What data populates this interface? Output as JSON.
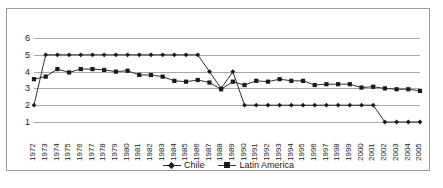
{
  "chart_data": {
    "type": "line",
    "title": "",
    "subtitle": "",
    "xlabel": "",
    "ylabel": "",
    "ylim": [
      1,
      6
    ],
    "yticks": [
      1,
      2,
      3,
      4,
      5,
      6
    ],
    "grid": true,
    "legend_position": "bottom",
    "categories": [
      "1972",
      "1973",
      "1974",
      "1975",
      "1976",
      "1977",
      "1978",
      "1979",
      "1980",
      "1981",
      "1982",
      "1983",
      "1984",
      "1985",
      "1986",
      "1987",
      "1988",
      "1989",
      "1990",
      "1991",
      "1992",
      "1993",
      "1994",
      "1995",
      "1996",
      "1997",
      "1998",
      "1999",
      "2000",
      "2001",
      "2002",
      "2003",
      "2004",
      "2005"
    ],
    "series": [
      {
        "name": "Chile",
        "marker": "diamond",
        "color": "#1a1a1a",
        "values": [
          2,
          5,
          5,
          5,
          5,
          5,
          5,
          5,
          5,
          5,
          5,
          5,
          5,
          5,
          5,
          4,
          3,
          4,
          2,
          2,
          2,
          2,
          2,
          2,
          2,
          2,
          2,
          2,
          2,
          2,
          1,
          1,
          1,
          1
        ]
      },
      {
        "name": "Latin America",
        "marker": "square",
        "color": "#1a1a1a",
        "values": [
          3.55,
          3.7,
          4.15,
          3.95,
          4.15,
          4.15,
          4.1,
          4.0,
          4.05,
          3.8,
          3.8,
          3.7,
          3.45,
          3.4,
          3.5,
          3.35,
          2.95,
          3.4,
          3.2,
          3.45,
          3.4,
          3.55,
          3.45,
          3.45,
          3.2,
          3.25,
          3.25,
          3.25,
          3.05,
          3.1,
          3.0,
          2.95,
          2.95,
          2.85
        ]
      }
    ]
  },
  "legend": {
    "entries": [
      {
        "label": "Chile"
      },
      {
        "label": "Latin America"
      }
    ]
  }
}
